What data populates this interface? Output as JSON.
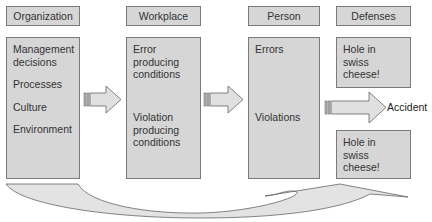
{
  "columns": [
    {
      "header": "Organization",
      "items": [
        "Management decisions",
        "Processes",
        "Culture",
        "Environment"
      ]
    },
    {
      "header": "Workplace",
      "items": [
        "Error producing conditions",
        "Violation producing conditions"
      ]
    },
    {
      "header": "Person",
      "items": [
        "Errors",
        "Violations"
      ]
    },
    {
      "header": "Defenses",
      "items": [
        "Hole in swiss cheese!",
        "Hole in swiss cheese!"
      ]
    }
  ],
  "outcome": "Accident",
  "colors": {
    "box_fill": "#d6d6d6",
    "box_border": "#7a7a7a",
    "arrow_fill": "#e0e0e0",
    "text": "#333333"
  }
}
